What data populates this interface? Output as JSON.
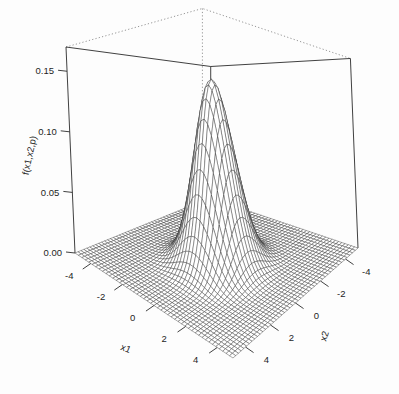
{
  "chart_data": {
    "type": "surface",
    "title": "",
    "xlabel": "x1",
    "ylabel": "x2",
    "zlabel": "f(x1,x2,p)",
    "x_ticks": [
      "-4",
      "-2",
      "0",
      "2",
      "4"
    ],
    "x_tick_values": [
      -4,
      -2,
      0,
      2,
      4
    ],
    "y_ticks": [
      "4",
      "2",
      "0",
      "-2",
      "-4"
    ],
    "y_tick_values": [
      4,
      2,
      0,
      -2,
      -4
    ],
    "z_ticks": [
      "0.00",
      "0.05",
      "0.10",
      "0.15"
    ],
    "z_tick_values": [
      0.0,
      0.05,
      0.1,
      0.15
    ],
    "xlim": [
      -5,
      5
    ],
    "ylim": [
      -5,
      5
    ],
    "zlim": [
      0,
      0.17
    ],
    "grid": false,
    "legend": "none",
    "surface": {
      "function": "bivariate-normal-density",
      "description": "Standard bivariate normal density surface f(x1,x2,p) = 1/(2*pi*sqrt(1-p^2)) * exp(-(x1^2 - 2*p*x1*x2 + x2^2)/(2*(1-p^2)))",
      "correlation_p": 0.0,
      "peak_value": 0.159,
      "peak_at": [
        0,
        0
      ],
      "mesh_n": 46
    },
    "colors": {
      "mesh_line": "#3a3a3a",
      "facet_fill": "#ffffff",
      "box_front": "#2b2b2b",
      "box_back": "#8a8a8a",
      "background": "#fdfdfd",
      "text": "#1d1d1d"
    },
    "view": {
      "projection": "perspective",
      "theta": -35,
      "phi": 22,
      "box": true,
      "back_edges_dotted": true
    }
  }
}
